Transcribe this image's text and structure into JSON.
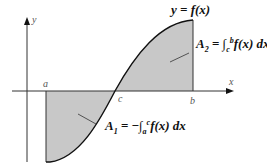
{
  "diagram": {
    "curve_label": "y = f(x)",
    "axis_labels": {
      "x": "x",
      "y": "y"
    },
    "points": {
      "a": "a",
      "b": "b",
      "c": "c"
    },
    "area_2": {
      "name": "A",
      "sub": "2",
      "eq": " = ",
      "int": "∫",
      "lower": "c",
      "upper": "b",
      "integrand": "f(x) dx"
    },
    "area_1": {
      "name": "A",
      "sub": "1",
      "eq": " = −",
      "int": "∫",
      "lower": "a",
      "upper": "c",
      "integrand": "f(x) dx"
    },
    "colors": {
      "fill": "#c8c8c8",
      "curve": "#111111",
      "axis": "#333333"
    }
  }
}
